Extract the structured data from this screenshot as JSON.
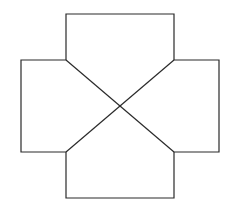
{
  "diagram": {
    "type": "cross-shaped net",
    "canvas": {
      "width": 229,
      "height": 206,
      "background": "#ffffff"
    },
    "stroke_color": "#2a2a2a",
    "stroke_width": 1.2,
    "center": {
      "x": 120,
      "y": 106
    },
    "inner_square": {
      "x1": 66,
      "y1": 60,
      "x2": 174,
      "y2": 152
    },
    "panels": [
      {
        "id": "top",
        "points": "66,60 66,14 174,14 174,60"
      },
      {
        "id": "right",
        "points": "174,60 219,60 219,152 174,152"
      },
      {
        "id": "bottom",
        "points": "174,152 174,198 66,198 66,152"
      },
      {
        "id": "left",
        "points": "66,152 21,152 21,60 66,60"
      }
    ],
    "diagonals": [
      {
        "id": "diagonal-tl-br",
        "x1": 66,
        "y1": 60,
        "x2": 174,
        "y2": 152
      },
      {
        "id": "diagonal-tr-bl",
        "x1": 174,
        "y1": 60,
        "x2": 66,
        "y2": 152
      }
    ]
  }
}
